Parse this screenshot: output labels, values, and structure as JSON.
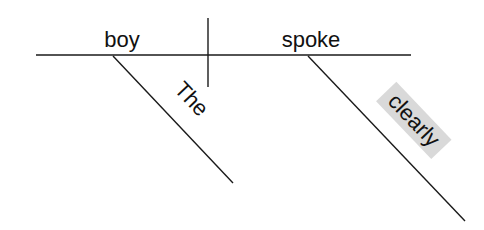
{
  "diagram": {
    "type": "Reed-Kellogg sentence diagram",
    "sentence_words": {
      "subject": "boy",
      "verb": "spoke",
      "subject_modifier": "The",
      "verb_modifier": "clearly"
    },
    "highlighted_word": "clearly",
    "colors": {
      "line": "#1a1a1a",
      "text": "#111111",
      "highlight": "#d9d9d9",
      "background": "#ffffff"
    }
  }
}
